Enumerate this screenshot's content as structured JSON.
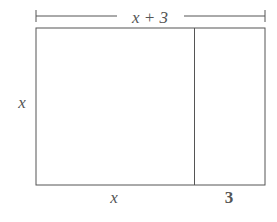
{
  "diagram": {
    "type": "area-model-rectangle",
    "top_label": "x + 3",
    "left_label": "x",
    "bottom_labels": [
      "x",
      "3"
    ],
    "stroke_color": "#555555",
    "background": "#ffffff"
  }
}
